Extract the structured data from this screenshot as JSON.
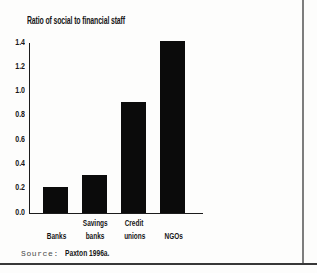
{
  "chart_data": {
    "type": "bar",
    "title": "Ratio of social to financial staff",
    "categories": [
      "Banks",
      "Savings banks",
      "Credit unions",
      "NGOs"
    ],
    "category_lines": [
      [
        "Banks"
      ],
      [
        "Savings",
        "banks"
      ],
      [
        "Credit",
        "unions"
      ],
      [
        "NGOs"
      ]
    ],
    "values": [
      0.2,
      0.3,
      0.9,
      1.4
    ],
    "xlabel": "",
    "ylabel": "",
    "ylim": [
      0,
      1.4
    ],
    "yticks": [
      0.0,
      0.2,
      0.4,
      0.6,
      0.8,
      1.0,
      1.2,
      1.4
    ],
    "ytick_labels": [
      "0.0",
      "0.2",
      "0.4",
      "0.6",
      "0.8",
      "1.0",
      "1.2",
      "1.4"
    ],
    "grid": false,
    "legend": false,
    "bar_color": "#0b0b0b",
    "axis_color": "#1c1c1c"
  },
  "source": {
    "prefix": "Source:",
    "citation": "Paxton 1996a."
  },
  "frame": {
    "background": "#fdfdfc",
    "right_border_color": "#7d7d7d",
    "bottom_border_color": "#383838"
  }
}
